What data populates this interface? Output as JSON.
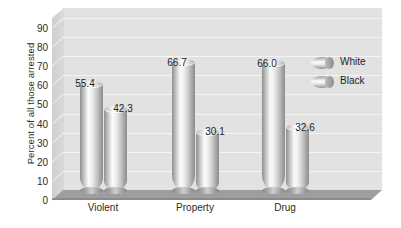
{
  "chart_data": {
    "type": "bar",
    "title": "",
    "subtitle": "",
    "xlabel": "",
    "ylabel": "Percent of all those arrested",
    "categories": [
      "Violent",
      "Property",
      "Drug"
    ],
    "series": [
      {
        "name": "White",
        "values": [
          55.4,
          66.7,
          66.0
        ]
      },
      {
        "name": "Black",
        "values": [
          42.3,
          30.1,
          32.6
        ]
      }
    ],
    "ylim": [
      0,
      90
    ],
    "ytick_step": 10,
    "yticks": [
      0,
      10,
      20,
      30,
      40,
      50,
      60,
      70,
      80,
      90
    ],
    "ytick_labels": [
      "0",
      "10",
      "20",
      "30",
      "40",
      "50",
      "60",
      "70",
      "80",
      "90"
    ],
    "data_labels": [
      "55.4",
      "42.3",
      "66.7",
      "30.1",
      "66.0",
      "32.6"
    ],
    "grid": true,
    "grid_axis": "y",
    "legend_position": "right",
    "legend_entries": [
      "White",
      "Black"
    ],
    "style": "3d-cylinder",
    "colors": {
      "plot_background": "#e2e2e2",
      "floor": "#9e9e9e",
      "gridline": "#f4f4f4",
      "bar_light": "#fbfbfb",
      "bar_dark": "#8d8d8d",
      "text": "#1f1f1f",
      "page_background": "#ffffff"
    }
  },
  "legend": {
    "items": [
      {
        "label": "White",
        "icon": "cylinder-swatch-icon"
      },
      {
        "label": "Black",
        "icon": "cylinder-swatch-icon"
      }
    ]
  }
}
